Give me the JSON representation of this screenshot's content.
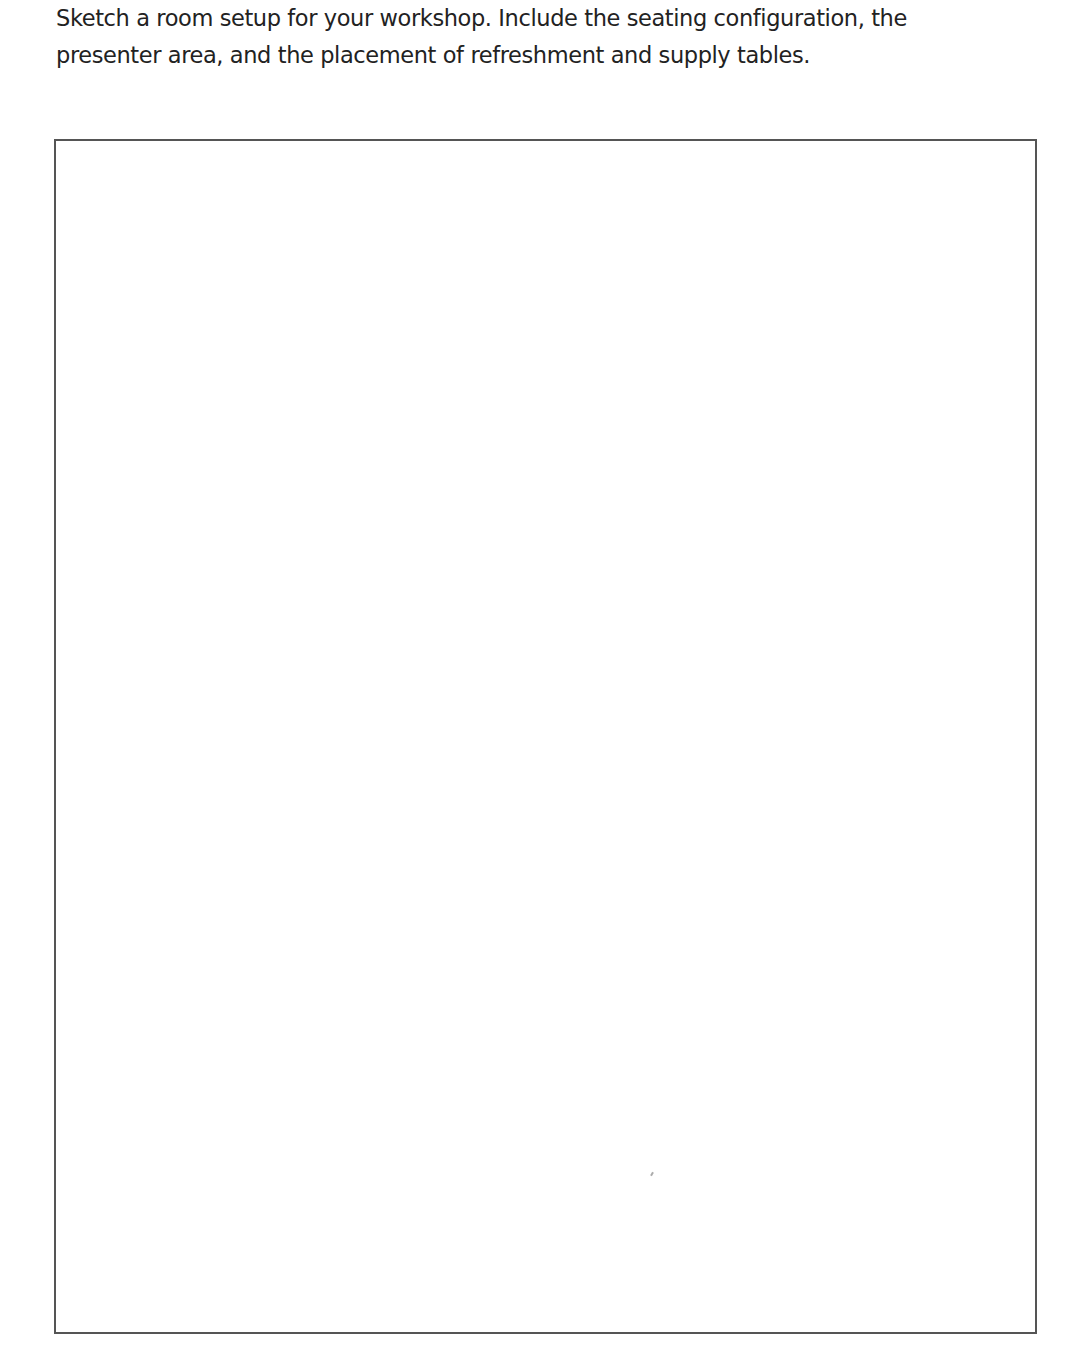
{
  "document": {
    "prompt": {
      "line1": "Sketch a room setup for your workshop. Include the seating configuration, the",
      "line2": "presenter area, and the placement of refreshment and supply tables."
    },
    "sketch_area": {
      "label": "blank drawing area",
      "border_color": "#555555"
    }
  }
}
